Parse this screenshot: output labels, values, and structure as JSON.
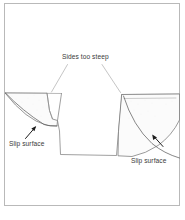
{
  "figure": {
    "type": "geotechnical-cross-section",
    "title_visible": false,
    "frame": {
      "border_color": "#b9b9b9",
      "background": "#ffffff"
    },
    "line_color": "#555555",
    "fill_color": "#fbfbfb",
    "labels": {
      "top": "Sides too steep",
      "left": "Slip surface",
      "right": "Slip surface"
    },
    "annotations": [
      {
        "name": "sides-too-steep",
        "text": "Sides too steep",
        "leader_lines": 2
      },
      {
        "name": "slip-surface-left",
        "text": "Slip surface",
        "arrow": true
      },
      {
        "name": "slip-surface-right",
        "text": "Slip surface",
        "arrow": true
      }
    ],
    "elements": [
      {
        "name": "ground-line-left",
        "description": "ground surface left of excavation"
      },
      {
        "name": "ground-line-right",
        "description": "ground surface right of excavation"
      },
      {
        "name": "excavation-trench",
        "description": "trapezoidal trench with steep sides"
      },
      {
        "name": "slip-block-left",
        "description": "failed soil wedge on left side"
      },
      {
        "name": "slip-block-right",
        "description": "failed soil wedge on right side"
      }
    ],
    "caption_ghost": ""
  }
}
